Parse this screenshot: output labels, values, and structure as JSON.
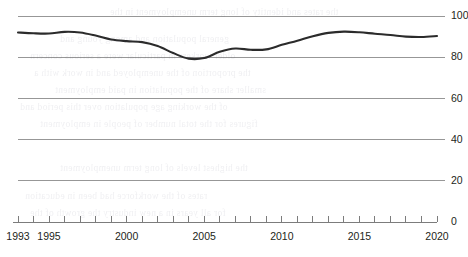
{
  "chart_data": {
    "type": "line",
    "title": "",
    "subtitle": "",
    "xlabel": "",
    "ylabel": "",
    "xlim": [
      1993,
      2020
    ],
    "ylim": [
      0,
      100
    ],
    "ytick_values": [
      0,
      20,
      40,
      60,
      80,
      100
    ],
    "ytick_labels": [
      "0",
      "20",
      "40",
      "60",
      "80",
      "100"
    ],
    "xtick_labels": [
      "1993",
      "1995",
      "2000",
      "2005",
      "2010",
      "2015",
      "2020"
    ],
    "xtick_label_values": [
      1993,
      1995,
      2000,
      2005,
      2010,
      2015,
      2020
    ],
    "x_minor_ticks_every": 1,
    "grid": "horizontal",
    "legend": "none",
    "line_color": "#2b2b2b",
    "grid_color": "#8c8c8c",
    "axis_color": "#6e6e6e",
    "x": [
      1993,
      1994,
      1995,
      1996,
      1997,
      1998,
      1999,
      2000,
      2001,
      2002,
      2003,
      2004,
      2005,
      2006,
      2007,
      2008,
      2009,
      2010,
      2011,
      2012,
      2013,
      2014,
      2015,
      2016,
      2017,
      2018,
      2019,
      2020
    ],
    "values": [
      92.0,
      91.6,
      91.5,
      92.3,
      92.0,
      90.5,
      88.6,
      87.8,
      87.3,
      85.4,
      82.0,
      79.3,
      79.6,
      82.6,
      84.2,
      83.6,
      83.8,
      86.0,
      88.0,
      90.2,
      91.8,
      92.4,
      92.1,
      91.4,
      90.8,
      90.0,
      89.8,
      90.3
    ],
    "series": [
      {
        "name": "series-1",
        "values": [
          92.0,
          91.6,
          91.5,
          92.3,
          92.0,
          90.5,
          88.6,
          87.8,
          87.3,
          85.4,
          82.0,
          79.3,
          79.6,
          82.6,
          84.2,
          83.6,
          83.8,
          86.0,
          88.0,
          90.2,
          91.8,
          92.4,
          92.1,
          91.4,
          90.8,
          90.0,
          89.8,
          90.3
        ]
      }
    ]
  },
  "bleed_through_text": {
    "note": "faint illegible mirrored show-through text from reverse page",
    "lines": [
      "the rates and identity of long term unemployment in the",
      "general population and among young and",
      "older workers in particular were a serious concern",
      "the proportion of the unemployed and in work with a",
      "smaller share of the population in paid employment",
      "of the working age population over this period and",
      "figures for the total number of people in employment",
      "the highest levels of long term unemployment",
      "rates of the workforce had been in education",
      "for all years in a new industry the growth of the"
    ]
  }
}
